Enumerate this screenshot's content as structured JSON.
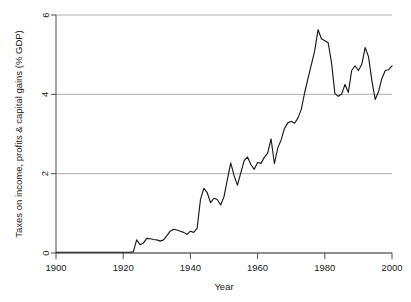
{
  "chart_data": {
    "type": "line",
    "title": "",
    "xlabel": "Year",
    "ylabel": "Taxes on income, profits & capital gains (% GDP)",
    "xlim": [
      1900,
      2000
    ],
    "ylim": [
      0,
      6
    ],
    "xticks": [
      1900,
      1920,
      1940,
      1960,
      1980,
      2000
    ],
    "yticks": [
      0,
      2,
      4,
      6
    ],
    "xtick_labels": [
      "1900",
      "1920",
      "1940",
      "1960",
      "1980",
      "2000"
    ],
    "ytick_labels": [
      "0",
      "2",
      "4",
      "6"
    ],
    "grid": "horizontal",
    "legend": "none",
    "line_color": "#1a1a1a",
    "grid_color": "#9a9a9a",
    "axis_color": "#3a3a3a",
    "background_color": "#ffffff",
    "series": [
      {
        "name": "Taxes on income, profits & capital gains",
        "x": [
          1900,
          1901,
          1902,
          1903,
          1904,
          1905,
          1906,
          1907,
          1908,
          1909,
          1910,
          1911,
          1912,
          1913,
          1914,
          1915,
          1916,
          1917,
          1918,
          1919,
          1920,
          1921,
          1922,
          1923,
          1924,
          1925,
          1926,
          1927,
          1928,
          1929,
          1930,
          1931,
          1932,
          1933,
          1934,
          1935,
          1936,
          1937,
          1938,
          1939,
          1940,
          1941,
          1942,
          1943,
          1944,
          1945,
          1946,
          1947,
          1948,
          1949,
          1950,
          1951,
          1952,
          1953,
          1954,
          1955,
          1956,
          1957,
          1958,
          1959,
          1960,
          1961,
          1962,
          1963,
          1964,
          1965,
          1966,
          1967,
          1968,
          1969,
          1970,
          1971,
          1972,
          1973,
          1974,
          1975,
          1976,
          1977,
          1978,
          1979,
          1980,
          1981,
          1982,
          1983,
          1984,
          1985,
          1986,
          1987,
          1988,
          1989,
          1990,
          1991,
          1992,
          1993,
          1994,
          1995,
          1996,
          1997,
          1998,
          1999,
          2000
        ],
        "y": [
          0.02,
          0.02,
          0.02,
          0.02,
          0.02,
          0.02,
          0.02,
          0.02,
          0.02,
          0.02,
          0.02,
          0.02,
          0.02,
          0.02,
          0.02,
          0.02,
          0.02,
          0.02,
          0.02,
          0.02,
          0.02,
          0.02,
          0.02,
          0.03,
          0.33,
          0.21,
          0.25,
          0.37,
          0.36,
          0.34,
          0.33,
          0.3,
          0.33,
          0.44,
          0.55,
          0.6,
          0.58,
          0.55,
          0.52,
          0.47,
          0.55,
          0.52,
          0.62,
          1.35,
          1.63,
          1.52,
          1.27,
          1.38,
          1.35,
          1.21,
          1.42,
          1.85,
          2.27,
          1.95,
          1.71,
          2.02,
          2.33,
          2.42,
          2.23,
          2.11,
          2.28,
          2.26,
          2.41,
          2.52,
          2.88,
          2.25,
          2.65,
          2.85,
          3.14,
          3.28,
          3.32,
          3.27,
          3.4,
          3.62,
          4.04,
          4.4,
          4.75,
          5.1,
          5.63,
          5.4,
          5.35,
          5.3,
          4.8,
          4.02,
          3.95,
          4.0,
          4.25,
          4.05,
          4.6,
          4.72,
          4.6,
          4.75,
          5.18,
          4.95,
          4.35,
          3.87,
          4.07,
          4.4,
          4.6,
          4.62,
          4.72
        ]
      }
    ]
  },
  "figure": {
    "plot_area": {
      "left": 56,
      "right": 392,
      "top": 15,
      "bottom": 253
    }
  }
}
